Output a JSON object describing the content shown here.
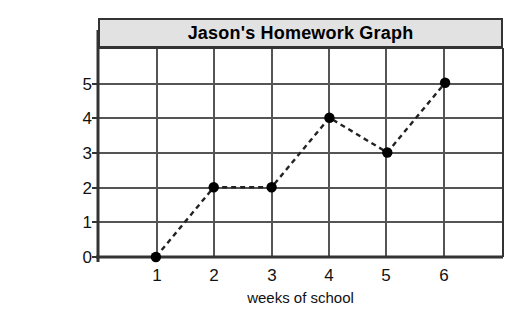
{
  "chart_data": {
    "type": "line",
    "title": "Jason's Homework Graph",
    "xlabel": "weeks of school",
    "ylabel": "number of homework assignments turned in",
    "ylabel_line1": "number of homework",
    "ylabel_line2": "assignments turned in",
    "x": [
      1,
      2,
      3,
      4,
      5,
      6
    ],
    "values": [
      0,
      2,
      2,
      4,
      3,
      5
    ],
    "xticks": [
      "1",
      "2",
      "3",
      "4",
      "5",
      "6"
    ],
    "yticks": [
      "0",
      "1",
      "2",
      "3",
      "4",
      "5"
    ],
    "xlim": [
      0.0,
      7.0
    ],
    "ylim": [
      0,
      6
    ],
    "grid": true,
    "legend": "none",
    "line_style": "dashed",
    "marker": "filled-circle",
    "colors": {
      "line": "#222222",
      "marker": "#000000",
      "grid": "#555555",
      "frame": "#333333",
      "title_band": "#e2e2e2",
      "background": "#ffffff",
      "text": "#111111"
    },
    "points": [
      {
        "week": "1",
        "assignments": "0"
      },
      {
        "week": "2",
        "assignments": "2"
      },
      {
        "week": "3",
        "assignments": "2"
      },
      {
        "week": "4",
        "assignments": "4"
      },
      {
        "week": "5",
        "assignments": "3"
      },
      {
        "week": "6",
        "assignments": "5"
      }
    ]
  }
}
